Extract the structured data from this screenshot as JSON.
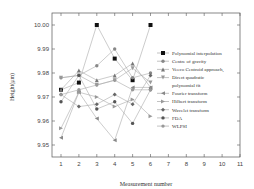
{
  "chart_data": {
    "type": "line",
    "title": "",
    "xlabel": "Measurement number",
    "ylabel": "Height(μm)",
    "xlim": [
      0.5,
      11
    ],
    "ylim": [
      9.945,
      10.005
    ],
    "x": [
      1,
      2,
      3,
      4,
      5,
      6
    ],
    "xticks": [
      "1",
      "2",
      "3",
      "4",
      "5",
      "6",
      "7",
      "8",
      "9",
      "10",
      "11"
    ],
    "yticks": [
      "9.95",
      "9.96",
      "9.97",
      "9.98",
      "9.99",
      "10.00"
    ],
    "grid": false,
    "legend_position": "right-inside",
    "series": [
      {
        "name": "Polynomial interpolation",
        "marker": "square-filled",
        "values": [
          9.973,
          9.976,
          10.0,
          9.986,
          9.977,
          10.0
        ]
      },
      {
        "name": "Centre of gravity",
        "marker": "circle-gray",
        "values": [
          9.978,
          9.979,
          9.983,
          9.99,
          9.978,
          9.98
        ]
      },
      {
        "name": "Veeco Centroid approach",
        "marker": "triangle-up",
        "values": [
          9.973,
          9.981,
          9.977,
          9.979,
          9.984,
          9.974
        ]
      },
      {
        "name": "Direct quadratic polynomial fit",
        "marker": "triangle-down",
        "values": [
          9.978,
          9.979,
          9.975,
          9.977,
          9.982,
          9.976
        ]
      },
      {
        "name": "Fourier transform",
        "marker": "triangle-left",
        "values": [
          9.953,
          9.972,
          9.961,
          9.952,
          9.974,
          9.974
        ]
      },
      {
        "name": "Hilbert transform",
        "marker": "triangle-right",
        "values": [
          9.957,
          9.972,
          9.97,
          9.966,
          9.969,
          9.962
        ]
      },
      {
        "name": "Wavelet transform",
        "marker": "diamond",
        "values": [
          9.971,
          9.966,
          9.967,
          9.971,
          9.967,
          9.979
        ]
      },
      {
        "name": "FDA",
        "marker": "circle-dark",
        "values": [
          9.968,
          9.979,
          9.965,
          9.968,
          9.959,
          9.973
        ]
      },
      {
        "name": "WLPSI",
        "marker": "hexagon",
        "values": [
          9.971,
          9.973,
          9.975,
          9.977,
          9.973,
          9.973
        ]
      }
    ]
  }
}
